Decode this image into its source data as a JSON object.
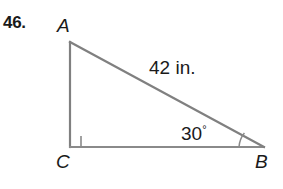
{
  "problem": {
    "number_label": "46."
  },
  "figure": {
    "kind": "right-triangle-diagram",
    "vertices": [
      {
        "name": "A",
        "label": "A",
        "x": 70,
        "y": 42
      },
      {
        "name": "C",
        "label": "C",
        "x": 70,
        "y": 147
      },
      {
        "name": "B",
        "label": "B",
        "x": 264,
        "y": 147
      }
    ],
    "side_label": "42 in.",
    "angle_label_value": "30",
    "angle_label_degree_symbol": "°",
    "right_angle_marker": "right-angle-square",
    "line_color": "#808080",
    "text_color": "#1a1a1a",
    "background_color": "#ffffff"
  }
}
